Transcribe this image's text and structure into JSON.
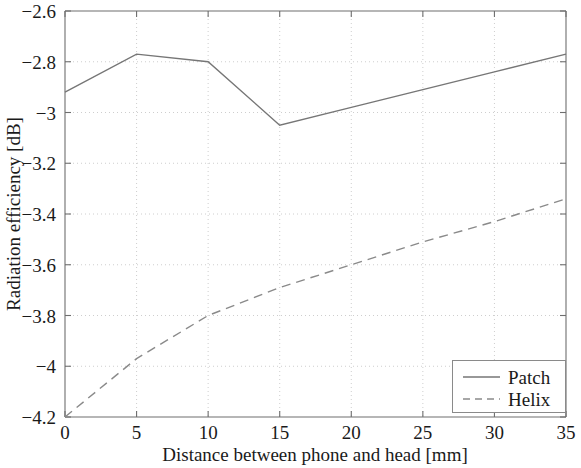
{
  "chart_data": {
    "type": "line",
    "title": "",
    "xlabel": "Distance between phone and head [mm]",
    "ylabel": "Radiation efficiency [dB]",
    "xlim": [
      0,
      35
    ],
    "ylim": [
      -4.2,
      -2.6
    ],
    "xticks": [
      0,
      5,
      10,
      15,
      20,
      25,
      30,
      35
    ],
    "xtick_labels": [
      "0",
      "5",
      "10",
      "15",
      "20",
      "25",
      "30",
      "35"
    ],
    "yticks": [
      -2.6,
      -2.8,
      -3,
      -3.2,
      -3.4,
      -3.6,
      -3.8,
      -4,
      -4.2
    ],
    "ytick_labels": [
      "−2.6",
      "−2.8",
      "−3",
      "−3.2",
      "−3.4",
      "−3.6",
      "−3.8",
      "−4",
      "−4.2"
    ],
    "grid": true,
    "legend_position": "lower right",
    "x": [
      0,
      5,
      10,
      15,
      20,
      25,
      30,
      35
    ],
    "series": [
      {
        "name": "Patch",
        "style": "solid",
        "color": "#767676",
        "values": [
          -2.92,
          -2.77,
          -2.8,
          -3.05,
          -2.98,
          -2.91,
          -2.84,
          -2.77
        ]
      },
      {
        "name": "Helix",
        "style": "dashed",
        "color": "#8a8a8a",
        "values": [
          -4.2,
          -3.97,
          -3.8,
          -3.69,
          -3.6,
          -3.51,
          -3.43,
          -3.34
        ]
      }
    ]
  },
  "legend": {
    "entries": [
      {
        "label": "Patch",
        "style": "solid"
      },
      {
        "label": "Helix",
        "style": "dashed"
      }
    ]
  },
  "axes": {
    "x_title": "Distance between phone and head [mm]",
    "y_title": "Radiation efficiency [dB]"
  }
}
